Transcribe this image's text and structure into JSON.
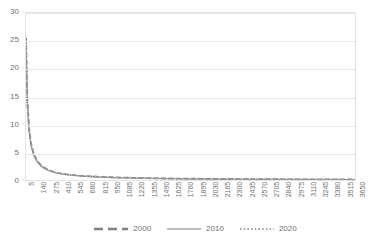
{
  "chart_data": {
    "type": "line",
    "title": "Rank-size distribution",
    "xlabel": "",
    "ylabel": "",
    "ylim": [
      0,
      30
    ],
    "yticks": [
      0,
      5,
      10,
      15,
      20,
      25,
      30
    ],
    "xlim": [
      5,
      3650
    ],
    "xticks": [
      5,
      140,
      275,
      410,
      545,
      680,
      815,
      950,
      1085,
      1220,
      1355,
      1490,
      1625,
      1760,
      1895,
      2030,
      2165,
      2300,
      2435,
      2570,
      2705,
      2840,
      2975,
      3110,
      3245,
      3380,
      3515,
      3650
    ],
    "grid": true,
    "legend_position": "bottom",
    "series": [
      {
        "name": "2000",
        "style": "dashed",
        "color": "#808080",
        "x": [
          5,
          20,
          40,
          60,
          90,
          130,
          180,
          250,
          340,
          460,
          620,
          820,
          1080,
          1400,
          1800,
          2300,
          2900,
          3650
        ],
        "values": [
          25.6,
          14.2,
          9.1,
          6.6,
          4.7,
          3.4,
          2.5,
          1.8,
          1.3,
          1.0,
          0.75,
          0.56,
          0.42,
          0.31,
          0.23,
          0.17,
          0.12,
          0.08
        ]
      },
      {
        "name": "2010",
        "style": "solid",
        "color": "#a6a6a6",
        "x": [
          5,
          20,
          40,
          60,
          90,
          130,
          180,
          250,
          340,
          460,
          620,
          820,
          1080,
          1400,
          1800,
          2300,
          2900,
          3650
        ],
        "values": [
          25.1,
          13.8,
          8.8,
          6.4,
          4.5,
          3.3,
          2.4,
          1.75,
          1.27,
          0.96,
          0.72,
          0.54,
          0.4,
          0.3,
          0.22,
          0.16,
          0.11,
          0.07
        ]
      },
      {
        "name": "2020",
        "style": "dotted",
        "color": "#7f7f7f",
        "x": [
          5,
          20,
          40,
          60,
          90,
          130,
          180,
          250,
          340,
          460,
          620,
          820,
          1080,
          1400,
          1800,
          2300,
          2900,
          3650
        ],
        "values": [
          24.6,
          13.4,
          8.6,
          6.2,
          4.4,
          3.2,
          2.35,
          1.7,
          1.24,
          0.93,
          0.7,
          0.52,
          0.39,
          0.29,
          0.21,
          0.15,
          0.1,
          0.06
        ]
      }
    ]
  },
  "legend": {
    "items": [
      {
        "label": "2000"
      },
      {
        "label": "2010"
      },
      {
        "label": "2020"
      }
    ]
  }
}
